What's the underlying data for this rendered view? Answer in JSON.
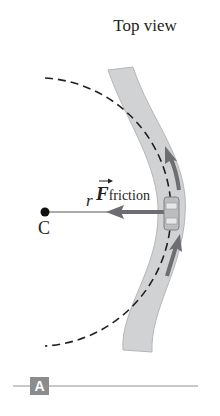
{
  "figure": {
    "title": "Top view",
    "center_label": "C",
    "radius_label": "r",
    "force_label": {
      "symbol": "F",
      "subscript": "friction",
      "vector_arrow": "→"
    },
    "panel_label": "A",
    "colors": {
      "road": "#d1d2d3",
      "road_edge": "#b5b6b8",
      "arrow": "#6d6e71",
      "dashed_path": "#231f20",
      "badge": "#8a8c8e",
      "rule": "#c7c8ca"
    },
    "icons": {
      "car": "car-top-view",
      "velocity_arrows": "arrow-up",
      "force_arrow": "arrow-left"
    }
  }
}
